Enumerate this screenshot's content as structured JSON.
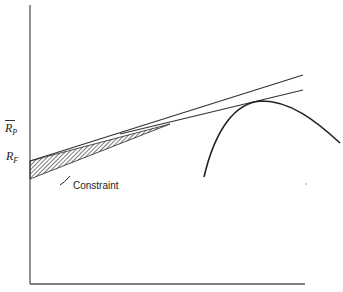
{
  "diagram": {
    "type": "efficient-frontier-with-riskless-lending",
    "y_axis_label": {
      "main": "R",
      "sub": "P",
      "overbar": true
    },
    "intercept_label": {
      "main": "R",
      "sub": "F"
    },
    "annotation": "Constraint",
    "elements": [
      "y-axis",
      "x-axis",
      "upper-capital-market-line",
      "lower-tangent-line",
      "efficient-frontier-curve",
      "hatched-constraint-region"
    ]
  },
  "colors": {
    "line": "#333333",
    "background": "#ffffff"
  }
}
